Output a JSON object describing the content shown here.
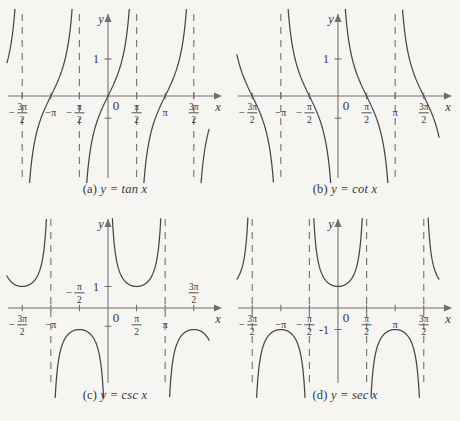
{
  "figure": {
    "background_color": "#f6f5f1",
    "curve_color": "#46464a",
    "axis_color": "#6e6e70",
    "asymptote_color": "#76767a"
  },
  "panels": [
    {
      "id": "a",
      "caption": "(a) y = tan x",
      "caption_prefix": "(a)",
      "caption_formula": "y = tan x",
      "function": "tan",
      "axis_x_label": "x",
      "axis_y_label": "y",
      "origin_label": "0",
      "y_tick_label": "1",
      "y_ticks": [
        1
      ],
      "x_tick_labels": [
        "-3π/2",
        "-π",
        "-π/2",
        "π/2",
        "π",
        "3π/2"
      ],
      "x_ticks_values": [
        -4.712,
        -3.1416,
        -1.5708,
        1.5708,
        3.1416,
        4.712
      ],
      "asymptotes": [
        -4.712,
        -1.5708,
        1.5708,
        4.712
      ],
      "asymptote_labels": [
        "-3π/2",
        "-π/2",
        "π/2",
        "3π/2"
      ],
      "zeros": [
        -3.1416,
        0,
        3.1416
      ],
      "xlim": [
        -5.6,
        5.6
      ],
      "ylim": [
        -2.4,
        2.4
      ]
    },
    {
      "id": "b",
      "caption": "(b) y = cot x",
      "caption_prefix": "(b)",
      "caption_formula": "y = cot x",
      "function": "cot",
      "axis_x_label": "x",
      "axis_y_label": "y",
      "origin_label": "0",
      "y_tick_label": "1",
      "y_ticks": [
        1
      ],
      "x_tick_labels": [
        "-3π/2",
        "-π",
        "-π/2",
        "π/2",
        "π",
        "3π/2"
      ],
      "x_ticks_values": [
        -4.712,
        -3.1416,
        -1.5708,
        1.5708,
        3.1416,
        4.712
      ],
      "asymptotes": [
        -3.1416,
        0,
        3.1416
      ],
      "asymptote_labels": [
        "-π",
        "0",
        "π"
      ],
      "zeros": [
        -4.712,
        -1.5708,
        1.5708,
        4.712
      ],
      "xlim": [
        -5.6,
        5.6
      ],
      "ylim": [
        -2.4,
        2.4
      ]
    },
    {
      "id": "c",
      "caption": "(c) y = csc x",
      "caption_prefix": "(c)",
      "caption_formula": "y = csc x",
      "function": "csc",
      "axis_x_label": "x",
      "axis_y_label": "y",
      "origin_label": "0",
      "y_tick_label": "1",
      "y_ticks": [
        1
      ],
      "x_tick_labels": [
        "-3π/2",
        "-π",
        "-π/2",
        "π/2",
        "π",
        "3π/2"
      ],
      "x_ticks_values": [
        -4.712,
        -3.1416,
        -1.5708,
        1.5708,
        3.1416,
        4.712
      ],
      "asymptotes": [
        -3.1416,
        0,
        3.1416
      ],
      "asymptote_labels": [
        "-π",
        "0",
        "π"
      ],
      "extrema": [
        {
          "x": -1.5708,
          "y": -1
        },
        {
          "x": 1.5708,
          "y": 1
        },
        {
          "x": 4.712,
          "y": -1
        }
      ],
      "xlim": [
        -5.6,
        5.6
      ],
      "ylim": [
        -4.2,
        4.2
      ]
    },
    {
      "id": "d",
      "caption": "(d) y = sec x",
      "caption_prefix": "(d)",
      "caption_formula": "y = sec x",
      "function": "sec",
      "axis_x_label": "x",
      "axis_y_label": "y",
      "origin_label": "0",
      "y_tick_label": "-1",
      "y_ticks": [
        -1
      ],
      "x_tick_labels": [
        "-3π/2",
        "-π",
        "-π/2",
        "π/2",
        "π",
        "3π/2"
      ],
      "x_ticks_values": [
        -4.712,
        -3.1416,
        -1.5708,
        1.5708,
        3.1416,
        4.712
      ],
      "asymptotes": [
        -4.712,
        -1.5708,
        1.5708,
        4.712
      ],
      "asymptote_labels": [
        "-3π/2",
        "-π/2",
        "π/2",
        "3π/2"
      ],
      "extrema": [
        {
          "x": -3.1416,
          "y": -1
        },
        {
          "x": 0,
          "y": 1
        },
        {
          "x": 3.1416,
          "y": -1
        }
      ],
      "xlim": [
        -5.6,
        5.6
      ],
      "ylim": [
        -4.2,
        4.2
      ]
    }
  ],
  "chart_data": {
    "type": "line",
    "xlabel": "x",
    "ylabel": "y",
    "grid": false,
    "legend": "none",
    "subplots": [
      {
        "label": "(a) y = tan x",
        "expression": "y = tan x",
        "xlim": [
          -5.6,
          5.6
        ],
        "ylim": [
          -2.4,
          2.4
        ],
        "xticks": [
          -4.712,
          -3.1416,
          -1.5708,
          1.5708,
          3.1416,
          4.712
        ],
        "xticklabels": [
          "-3π/2",
          "-π",
          "-π/2",
          "π/2",
          "π",
          "3π/2"
        ],
        "yticks": [
          1
        ],
        "yticklabels": [
          "1"
        ],
        "asymptotes_x": [
          -4.712,
          -1.5708,
          1.5708,
          4.712
        ],
        "x_intercepts": [
          -3.1416,
          0,
          3.1416
        ],
        "period": 3.1416
      },
      {
        "label": "(b) y = cot x",
        "expression": "y = cot x",
        "xlim": [
          -5.6,
          5.6
        ],
        "ylim": [
          -2.4,
          2.4
        ],
        "xticks": [
          -4.712,
          -3.1416,
          -1.5708,
          1.5708,
          3.1416,
          4.712
        ],
        "xticklabels": [
          "-3π/2",
          "-π",
          "-π/2",
          "π/2",
          "π",
          "3π/2"
        ],
        "yticks": [
          1
        ],
        "yticklabels": [
          "1"
        ],
        "asymptotes_x": [
          -3.1416,
          0,
          3.1416
        ],
        "x_intercepts": [
          -4.712,
          -1.5708,
          1.5708,
          4.712
        ],
        "period": 3.1416
      },
      {
        "label": "(c) y = csc x",
        "expression": "y = csc x",
        "xlim": [
          -5.6,
          5.6
        ],
        "ylim": [
          -4.2,
          4.2
        ],
        "xticks": [
          -4.712,
          -3.1416,
          -1.5708,
          1.5708,
          3.1416,
          4.712
        ],
        "xticklabels": [
          "-3π/2",
          "-π",
          "-π/2",
          "π/2",
          "π",
          "3π/2"
        ],
        "yticks": [
          1
        ],
        "yticklabels": [
          "1"
        ],
        "asymptotes_x": [
          -3.1416,
          0,
          3.1416
        ],
        "local_extrema": [
          [
            -1.5708,
            -1
          ],
          [
            1.5708,
            1
          ],
          [
            4.712,
            -1
          ]
        ],
        "period": 6.2832
      },
      {
        "label": "(d) y = sec x",
        "expression": "y = sec x",
        "xlim": [
          -5.6,
          5.6
        ],
        "ylim": [
          -4.2,
          4.2
        ],
        "xticks": [
          -4.712,
          -3.1416,
          -1.5708,
          1.5708,
          3.1416,
          4.712
        ],
        "xticklabels": [
          "-3π/2",
          "-π",
          "-π/2",
          "π/2",
          "π",
          "3π/2"
        ],
        "yticks": [
          -1
        ],
        "yticklabels": [
          "-1"
        ],
        "asymptotes_x": [
          -4.712,
          -1.5708,
          1.5708,
          4.712
        ],
        "local_extrema": [
          [
            -3.1416,
            -1
          ],
          [
            0,
            1
          ],
          [
            3.1416,
            -1
          ]
        ],
        "period": 6.2832
      }
    ]
  }
}
